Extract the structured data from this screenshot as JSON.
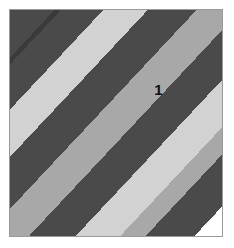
{
  "panel": {
    "width": 234,
    "height": 248,
    "background_color": "#ffffff",
    "border_color": "#9a9a9a",
    "border_width": 1
  },
  "chart_data": {
    "type": "diagram",
    "title": "",
    "subtitle": "",
    "xlabel": "",
    "ylabel": "",
    "grid": false,
    "legend": false,
    "background_color": "#ffffff",
    "stripe_angle_degrees": 45,
    "palette": {
      "dark": "#4a4a4a",
      "medium": "#a8a8a8",
      "light": "#d2d2d2",
      "white": "#ffffff",
      "separator": "#3a3a3a"
    },
    "regions": [
      {
        "label": "1",
        "fill": "#ffffff",
        "x_pct": 70,
        "y_pct": 35
      }
    ],
    "bands": [
      {
        "index": 1,
        "tone": "dark",
        "color": "#4a4a4a",
        "start_pct": 0.0,
        "end_pct": 10.5
      },
      {
        "index": 2,
        "tone": "separator",
        "color": "#3a3a3a",
        "start_pct": 10.5,
        "end_pct": 12.0
      },
      {
        "index": 3,
        "tone": "dark",
        "color": "#4a4a4a",
        "start_pct": 12.0,
        "end_pct": 22.0
      },
      {
        "index": 4,
        "tone": "light",
        "color": "#d2d2d2",
        "start_pct": 22.0,
        "end_pct": 32.5
      },
      {
        "index": 5,
        "tone": "dark",
        "color": "#4a4a4a",
        "start_pct": 32.5,
        "end_pct": 44.0
      },
      {
        "index": 6,
        "tone": "medium",
        "color": "#a8a8a8",
        "start_pct": 44.0,
        "end_pct": 54.5
      },
      {
        "index": 7,
        "tone": "dark",
        "color": "#4a4a4a",
        "start_pct": 54.5,
        "end_pct": 65.5
      },
      {
        "index": 8,
        "tone": "light",
        "color": "#d2d2d2",
        "start_pct": 65.5,
        "end_pct": 76.0
      },
      {
        "index": 9,
        "tone": "medium",
        "color": "#a8a8a8",
        "start_pct": 76.0,
        "end_pct": 82.0
      },
      {
        "index": 10,
        "tone": "dark",
        "color": "#4a4a4a",
        "start_pct": 82.0,
        "end_pct": 93.5
      },
      {
        "index": 11,
        "tone": "white",
        "color": "#ffffff",
        "start_pct": 93.5,
        "end_pct": 100.0
      }
    ]
  }
}
